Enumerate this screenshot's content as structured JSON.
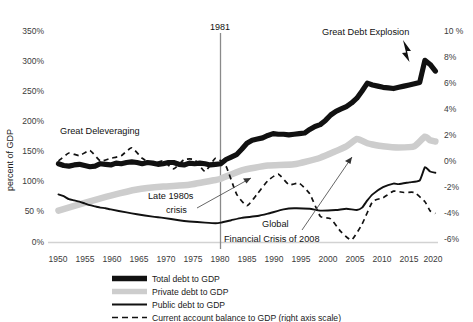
{
  "chart_data": {
    "type": "line",
    "title": "",
    "subtitle": "",
    "xlabel": "",
    "ylabel": "percent of GDP",
    "ylabel_right": "",
    "xlim": [
      1948,
      2022
    ],
    "ylim": [
      0,
      350
    ],
    "ylim_right": [
      -6,
      10
    ],
    "grid": false,
    "legend_position": "bottom-center",
    "x_ticks": [
      "1950",
      "1955",
      "1960",
      "1965",
      "1970",
      "1975",
      "1980",
      "1985",
      "1990",
      "1995",
      "2000",
      "2005",
      "2010",
      "2015",
      "2020"
    ],
    "y_ticks_left": [
      "0%",
      "50%",
      "100%",
      "150%",
      "200%",
      "250%",
      "300%",
      "350%"
    ],
    "y_ticks_right": [
      "-6%",
      "-4%",
      "-2%",
      "0%",
      "2%",
      "4%",
      "6%",
      "8%",
      "10%"
    ],
    "series": [
      {
        "name": "Total debt to GDP",
        "axis": "left",
        "style": "thick-solid",
        "color": "#111111",
        "x": [
          1950,
          1951,
          1952,
          1953,
          1954,
          1955,
          1956,
          1957,
          1958,
          1959,
          1960,
          1961,
          1962,
          1963,
          1964,
          1965,
          1966,
          1967,
          1968,
          1969,
          1970,
          1971,
          1972,
          1973,
          1974,
          1975,
          1976,
          1977,
          1978,
          1979,
          1980,
          1981,
          1982,
          1983,
          1984,
          1985,
          1986,
          1987,
          1988,
          1989,
          1990,
          1991,
          1992,
          1993,
          1994,
          1995,
          1996,
          1997,
          1998,
          1999,
          2000,
          2001,
          2002,
          2003,
          2004,
          2005,
          2006,
          2007,
          2008,
          2009,
          2010,
          2011,
          2012,
          2013,
          2014,
          2015,
          2016,
          2017,
          2018,
          2019,
          2020,
          2021,
          2022
        ],
        "values": [
          131,
          128,
          127,
          129,
          130,
          128,
          126,
          127,
          131,
          130,
          129,
          132,
          131,
          133,
          134,
          133,
          131,
          133,
          132,
          130,
          131,
          133,
          133,
          130,
          129,
          132,
          131,
          132,
          131,
          129,
          130,
          131,
          138,
          142,
          146,
          155,
          165,
          170,
          172,
          174,
          178,
          181,
          180,
          180,
          179,
          180,
          181,
          182,
          188,
          193,
          196,
          203,
          212,
          218,
          222,
          226,
          232,
          240,
          252,
          265,
          262,
          260,
          258,
          257,
          256,
          258,
          260,
          262,
          264,
          266,
          303,
          296,
          285
        ]
      },
      {
        "name": "Private debt to GDP",
        "axis": "left",
        "style": "thick-gray",
        "color": "#cdcdcd",
        "x": [
          1950,
          1955,
          1960,
          1965,
          1970,
          1975,
          1980,
          1981,
          1985,
          1990,
          1995,
          2000,
          2005,
          2007,
          2009,
          2010,
          2012,
          2015,
          2018,
          2020,
          2021,
          2022
        ],
        "values": [
          53,
          66,
          78,
          88,
          93,
          96,
          104,
          106,
          120,
          128,
          130,
          141,
          160,
          172,
          165,
          163,
          160,
          158,
          160,
          176,
          170,
          168
        ]
      },
      {
        "name": "Public debt to GDP",
        "axis": "left",
        "style": "thin-solid",
        "color": "#111111",
        "x": [
          1950,
          1951,
          1952,
          1953,
          1954,
          1955,
          1956,
          1957,
          1958,
          1959,
          1960,
          1963,
          1965,
          1968,
          1970,
          1973,
          1975,
          1978,
          1980,
          1981,
          1983,
          1985,
          1988,
          1990,
          1993,
          1995,
          1998,
          2000,
          2003,
          2005,
          2007,
          2008,
          2009,
          2010,
          2012,
          2014,
          2015,
          2017,
          2019,
          2020,
          2021,
          2022
        ],
        "values": [
          80,
          77,
          72,
          70,
          68,
          65,
          62,
          60,
          58,
          57,
          55,
          50,
          47,
          43,
          41,
          37,
          35,
          33,
          32,
          33,
          37,
          41,
          44,
          48,
          55,
          57,
          56,
          53,
          54,
          56,
          54,
          58,
          70,
          80,
          92,
          98,
          97,
          100,
          103,
          125,
          118,
          116
        ]
      },
      {
        "name": "Current account balance to GDP (right axis scale)",
        "axis": "right",
        "style": "dashed",
        "color": "#111111",
        "x": [
          1950,
          1952,
          1954,
          1956,
          1958,
          1960,
          1962,
          1964,
          1966,
          1968,
          1970,
          1972,
          1974,
          1976,
          1978,
          1980,
          1982,
          1984,
          1986,
          1988,
          1990,
          1992,
          1994,
          1996,
          1998,
          2000,
          2002,
          2004,
          2006,
          2008,
          2010,
          2012,
          2014,
          2016,
          2018,
          2020,
          2021,
          2022
        ],
        "values": [
          0.2,
          0.8,
          0.6,
          1.0,
          0.2,
          0.4,
          0.6,
          1.2,
          0.4,
          0.0,
          0.2,
          -0.4,
          0.3,
          0.3,
          -0.6,
          0.4,
          -0.2,
          -2.3,
          -3.2,
          -2.3,
          -1.3,
          -0.8,
          -1.6,
          -1.5,
          -2.3,
          -4.0,
          -4.2,
          -5.2,
          -5.8,
          -4.6,
          -2.9,
          -2.6,
          -2.1,
          -2.2,
          -2.2,
          -2.9,
          -3.6,
          -3.8
        ]
      }
    ],
    "annotations": [
      {
        "id": "great-deleveraging",
        "text": "Great Deleveraging",
        "x": 60,
        "y": 131
      },
      {
        "id": "great-debt-explosion",
        "text": "Great Debt Explosion",
        "x": 322,
        "y": 32
      },
      {
        "id": "late-1980s-crisis-line1",
        "text": "Late 1980s",
        "x": 160,
        "y": 196
      },
      {
        "id": "late-1980s-crisis-line2",
        "text": "crisis",
        "x": 176,
        "y": 210
      },
      {
        "id": "global-financial-crisis-line1",
        "text": "Global",
        "x": 265,
        "y": 224
      },
      {
        "id": "global-financial-crisis-line2",
        "text": "Financial Crisis of 2008",
        "x": 223,
        "y": 239
      },
      {
        "id": "year-marker-1981",
        "text": "1981",
        "x": 219,
        "y": 28
      }
    ],
    "vertical_marker": {
      "label": "1981",
      "year": 1981
    }
  },
  "axes": {
    "y_left_title": "percent of GDP",
    "y_left_ticks": [
      "350%",
      "300%",
      "250%",
      "200%",
      "150%",
      "100%",
      "50 %",
      "0%"
    ],
    "y_right_ticks": [
      "10 %",
      "8%",
      "6%",
      "4%",
      "2%",
      "0%",
      "-2%",
      "-4%",
      "-6%"
    ],
    "x_ticks": [
      "1950",
      "1955",
      "1960",
      "1965",
      "1970",
      "1975",
      "1980",
      "1985",
      "1990",
      "1995",
      "2000",
      "2005",
      "2010",
      "2015",
      "2020"
    ]
  },
  "annotations": {
    "great_deleveraging": "Great Deleveraging",
    "great_debt_explosion": "Great Debt Explosion",
    "late_1980s_crisis_1": "Late 1980s",
    "late_1980s_crisis_2": "crisis",
    "global_crisis_1": "Global",
    "global_crisis_2": "Financial Crisis of 2008",
    "year_1981": "1981"
  },
  "legend": {
    "items": [
      {
        "label": "Total debt to GDP",
        "swatch": "thick-black"
      },
      {
        "label": "Private debt to GDP",
        "swatch": "thick-gray"
      },
      {
        "label": "Public debt to GDP",
        "swatch": "thin-black"
      },
      {
        "label": "Current account balance to GDP (right axis scale)",
        "swatch": "dashed-black"
      }
    ]
  },
  "colors": {
    "total": "#111111",
    "private": "#cdcdcd",
    "public": "#111111",
    "current_account": "#111111",
    "axis": "#808080",
    "text": "#1a1a1a"
  }
}
